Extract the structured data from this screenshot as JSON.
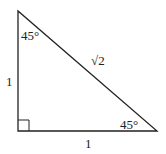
{
  "diagram": {
    "type": "right-triangle",
    "vertices": {
      "top": [
        18,
        11
      ],
      "bottom_left": [
        18,
        131
      ],
      "bottom_right": [
        157,
        131
      ]
    },
    "right_angle_marker": "bottom-left",
    "labels": {
      "top_angle": "45°",
      "bottom_right_angle": "45°",
      "vertical_leg": "1",
      "horizontal_leg": "1",
      "hypotenuse": "√2"
    },
    "colors": {
      "stroke": "#222222",
      "background": "#ffffff"
    }
  }
}
